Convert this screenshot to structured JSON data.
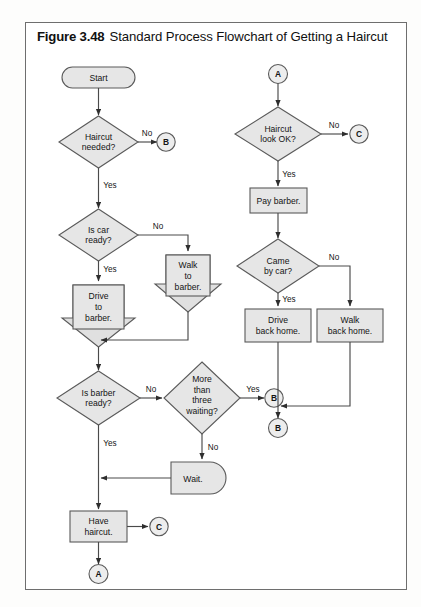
{
  "figure": {
    "number": "Figure 3.48",
    "title": "Standard Process Flowchart of Getting a Haircut"
  },
  "colors": {
    "shape_fill": "#e6e6e6",
    "shape_stroke": "#5a5a5a",
    "line": "#4a4a4a",
    "frame": "#6e6e6e",
    "text": "#141414",
    "page": "#ffffff"
  },
  "nodes": {
    "start": {
      "label": "Start",
      "shape": "terminator"
    },
    "haircut_needed": {
      "label_lines": [
        "Haircut",
        "needed?"
      ],
      "shape": "decision"
    },
    "conn_b_top": {
      "label": "B",
      "shape": "connector"
    },
    "is_car_ready": {
      "label_lines": [
        "Is car",
        "ready?"
      ],
      "shape": "decision"
    },
    "drive_to_barber": {
      "label_lines": [
        "Drive",
        "to",
        "barber."
      ],
      "shape": "process-arrow"
    },
    "walk_to_barber": {
      "label_lines": [
        "Walk",
        "to",
        "barber."
      ],
      "shape": "process-arrow"
    },
    "is_barber_ready": {
      "label_lines": [
        "Is barber",
        "ready?"
      ],
      "shape": "decision"
    },
    "more_than_three": {
      "label_lines": [
        "More",
        "than",
        "three",
        "waiting?"
      ],
      "shape": "decision"
    },
    "conn_b_mid": {
      "label": "B",
      "shape": "connector"
    },
    "wait": {
      "label": "Wait.",
      "shape": "delay"
    },
    "have_haircut": {
      "label_lines": [
        "Have",
        "haircut."
      ],
      "shape": "process"
    },
    "conn_c_left": {
      "label": "C",
      "shape": "connector"
    },
    "conn_a_bottom": {
      "label": "A",
      "shape": "connector"
    },
    "conn_a_top": {
      "label": "A",
      "shape": "connector"
    },
    "haircut_look_ok": {
      "label_lines": [
        "Haircut",
        "look OK?"
      ],
      "shape": "decision"
    },
    "conn_c_right": {
      "label": "C",
      "shape": "connector"
    },
    "pay_barber": {
      "label_lines": [
        "Pay barber."
      ],
      "shape": "process"
    },
    "came_by_car": {
      "label_lines": [
        "Came",
        "by car?"
      ],
      "shape": "decision"
    },
    "drive_back_home": {
      "label_lines": [
        "Drive",
        "back home."
      ],
      "shape": "process"
    },
    "walk_back_home": {
      "label_lines": [
        "Walk",
        "back home."
      ],
      "shape": "process"
    },
    "conn_b_bottom": {
      "label": "B",
      "shape": "connector"
    }
  },
  "edge_labels": {
    "haircut_needed_no": "No",
    "haircut_needed_yes": "Yes",
    "is_car_ready_no": "No",
    "is_car_ready_yes": "Yes",
    "is_barber_ready_no": "No",
    "is_barber_ready_yes": "Yes",
    "more_than_three_yes": "Yes",
    "more_than_three_no": "No",
    "haircut_look_ok_no": "No",
    "haircut_look_ok_yes": "Yes",
    "came_by_car_no": "No",
    "came_by_car_yes": "Yes"
  }
}
